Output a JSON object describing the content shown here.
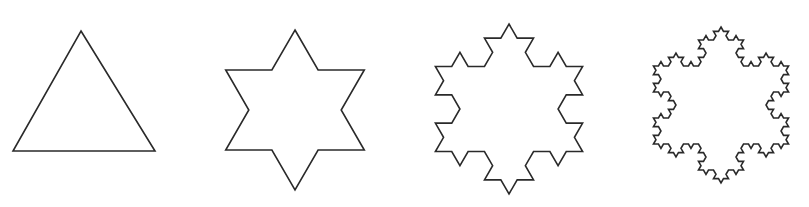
{
  "figure": {
    "stroke_color": "#2a2a2a",
    "background": "#ffffff",
    "shapes": [
      {
        "name": "koch-iteration-0",
        "iteration": 0,
        "label": "Triangle",
        "vertices": [
          [
            81,
            31
          ],
          [
            155,
            151
          ],
          [
            13,
            151
          ]
        ]
      },
      {
        "name": "koch-iteration-1",
        "iteration": 1,
        "label": "Star of David",
        "vertices": [
          [
            293,
            70
          ],
          [
            362,
            189
          ],
          [
            225,
            189
          ]
        ],
        "flip": true,
        "center": [
          295,
          110
        ],
        "radius": 80
      },
      {
        "name": "koch-iteration-2",
        "iteration": 2,
        "label": "Koch snowflake (2 iterations)",
        "center": [
          509,
          109
        ],
        "radius": 85
      },
      {
        "name": "koch-iteration-3",
        "iteration": 3,
        "label": "Koch snowflake (3 iterations)",
        "center": [
          721,
          105
        ],
        "radius": 78
      }
    ]
  }
}
